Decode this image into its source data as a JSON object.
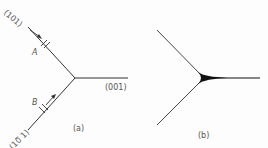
{
  "figure": {
    "panel_a": {
      "caption": "(a)",
      "labels": {
        "top_plane": "(101)",
        "bottom_plane": "(10̅ 1)",
        "right_plane": "(001)",
        "point_a": "A",
        "point_b": "B"
      }
    },
    "panel_b": {
      "caption": "(b)"
    },
    "colors": {
      "line": "#333333",
      "text": "#555555"
    }
  }
}
